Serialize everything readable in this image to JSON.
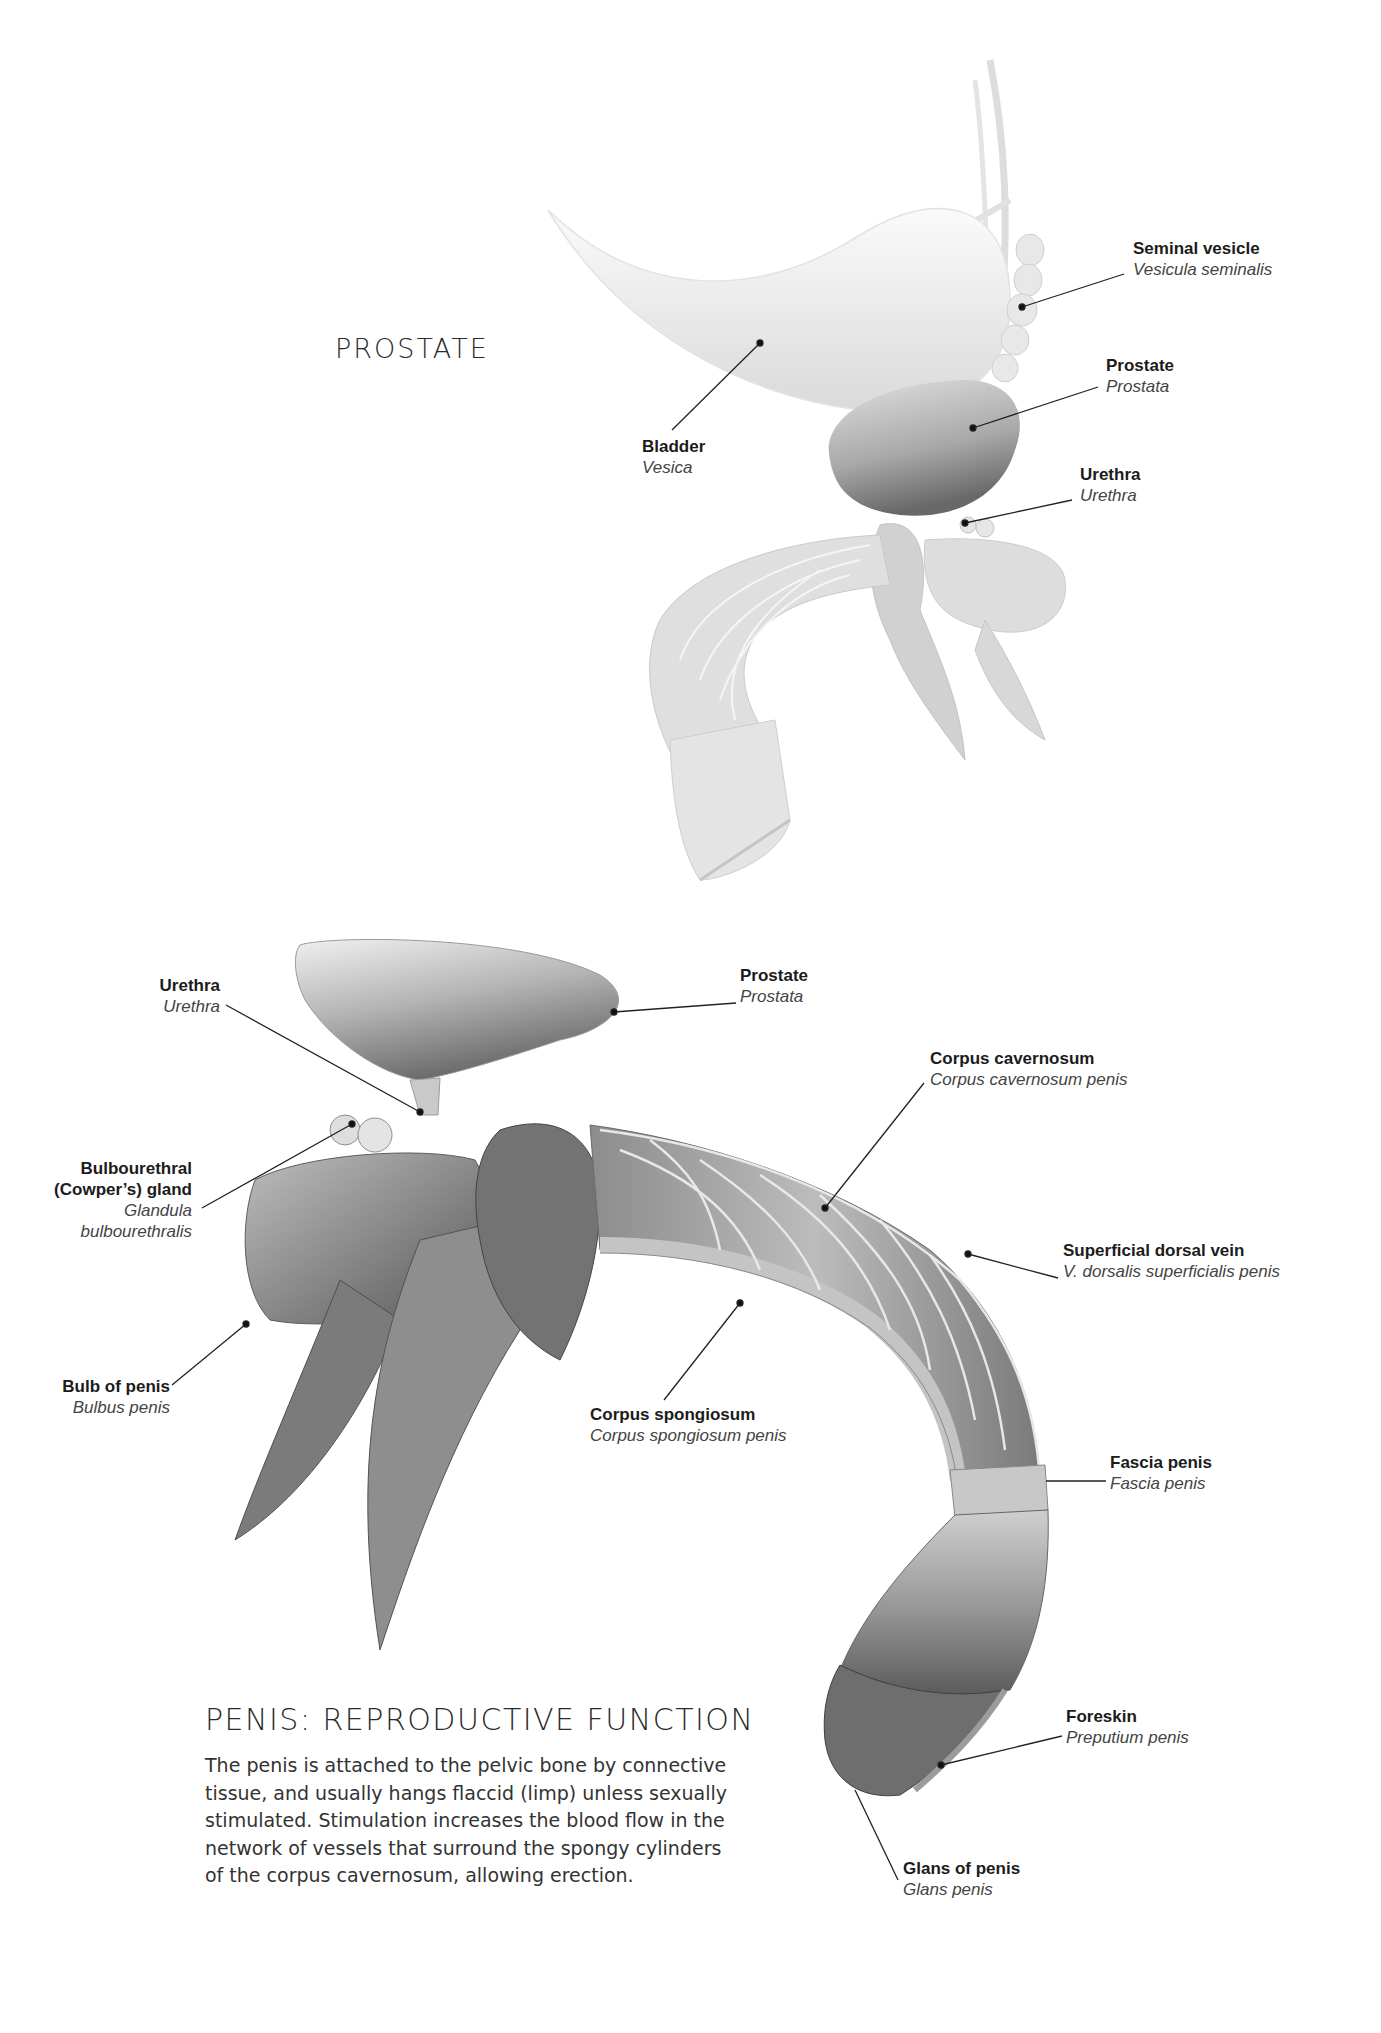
{
  "figure_top": {
    "title": "PROSTATE",
    "labels": {
      "seminal_vesicle": {
        "en": "Seminal vesicle",
        "la": "Vesicula seminalis"
      },
      "prostate": {
        "en": "Prostate",
        "la": "Prostata"
      },
      "bladder": {
        "en": "Bladder",
        "la": "Vesica"
      },
      "urethra": {
        "en": "Urethra",
        "la": "Urethra"
      }
    }
  },
  "figure_bottom": {
    "labels": {
      "urethra": {
        "en": "Urethra",
        "la": "Urethra"
      },
      "prostate": {
        "en": "Prostate",
        "la": "Prostata"
      },
      "corpus_cavernosum": {
        "en": "Corpus cavernosum",
        "la": "Corpus cavernosum penis"
      },
      "bulbourethral": {
        "en_line1": "Bulbourethral",
        "en_line2": "(Cowper’s) gland",
        "la_line1": "Glandula",
        "la_line2": "bulbourethralis"
      },
      "superficial_dorsal_vein": {
        "en": "Superficial dorsal vein",
        "la": "V. dorsalis superficialis penis"
      },
      "bulb_of_penis": {
        "en": "Bulb of penis",
        "la": "Bulbus penis"
      },
      "corpus_spongiosum": {
        "en": "Corpus spongiosum",
        "la": "Corpus spongiosum penis"
      },
      "fascia_penis": {
        "en": "Fascia penis",
        "la": "Fascia penis"
      },
      "foreskin": {
        "en": "Foreskin",
        "la": "Preputium penis"
      },
      "glans": {
        "en": "Glans of penis",
        "la": "Glans penis"
      }
    }
  },
  "text_block": {
    "heading": "PENIS: REPRODUCTIVE FUNCTION",
    "lines": [
      "The penis is attached to the pelvic bone by connective",
      "tissue, and usually hangs flaccid (limp) unless sexually",
      "stimulated. Stimulation increases the blood flow in the",
      "network of vessels that surround the spongy cylinders",
      "of the corpus cavernosum, allowing erection."
    ]
  },
  "colors": {
    "background": "#ffffff",
    "leader_line": "#222222",
    "tissue_light": "#e6e6e6",
    "tissue_mid": "#a8a8a8",
    "tissue_dark": "#5a5a5a"
  }
}
